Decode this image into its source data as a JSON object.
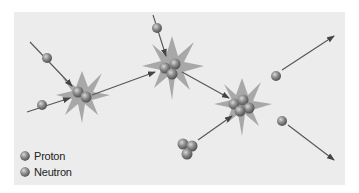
{
  "diagram": {
    "background_color": "#ececec",
    "star_color": "#a9a9a9",
    "arrow_color": "#555555",
    "particle_colors": {
      "proton": "#8d8d8d",
      "neutron": "#8f8f8f"
    }
  },
  "legend": {
    "items": [
      {
        "label": "Proton",
        "color": "#8d8d8d"
      },
      {
        "label": "Neutron",
        "color": "#8f8f8f"
      }
    ]
  },
  "reactions": [
    {
      "id": "reaction-1",
      "nucleus_particles": 2
    },
    {
      "id": "reaction-2",
      "nucleus_particles": 3
    },
    {
      "id": "reaction-3",
      "nucleus_particles": 4
    }
  ]
}
